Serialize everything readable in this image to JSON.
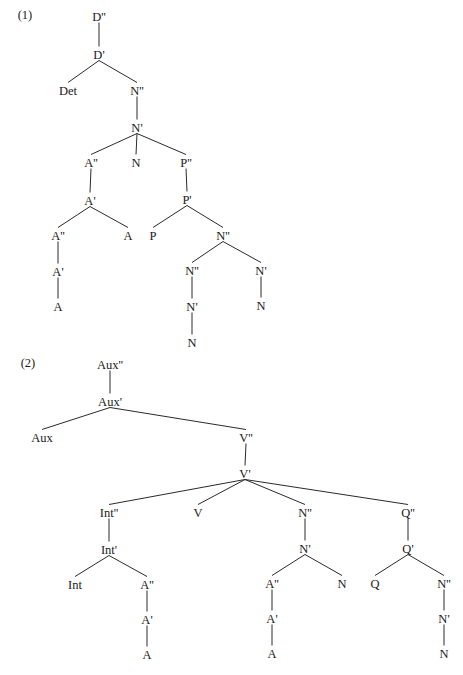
{
  "trees": [
    {
      "example_label": "(1)",
      "label_pos": [
        25,
        19
      ],
      "nodes": [
        {
          "id": "D2",
          "label": "D''",
          "x": 99,
          "y": 16
        },
        {
          "id": "D1",
          "label": "D'",
          "x": 99,
          "y": 54
        },
        {
          "id": "Det",
          "label": "Det",
          "x": 68,
          "y": 90
        },
        {
          "id": "N2a",
          "label": "N''",
          "x": 137,
          "y": 90
        },
        {
          "id": "N1a",
          "label": "N'",
          "x": 137,
          "y": 127
        },
        {
          "id": "A2a",
          "label": "A''",
          "x": 91,
          "y": 162
        },
        {
          "id": "Na",
          "label": "N",
          "x": 136,
          "y": 162
        },
        {
          "id": "P2",
          "label": "P''",
          "x": 186,
          "y": 162
        },
        {
          "id": "A1a",
          "label": "A'",
          "x": 90,
          "y": 200
        },
        {
          "id": "P1",
          "label": "P'",
          "x": 187,
          "y": 199
        },
        {
          "id": "A2b",
          "label": "A''",
          "x": 58,
          "y": 235
        },
        {
          "id": "Ab",
          "label": "A",
          "x": 128,
          "y": 235
        },
        {
          "id": "P",
          "label": "P",
          "x": 153,
          "y": 235
        },
        {
          "id": "N2b",
          "label": "N''",
          "x": 223,
          "y": 235
        },
        {
          "id": "A1b",
          "label": "A'",
          "x": 58,
          "y": 271
        },
        {
          "id": "N2c",
          "label": "N''",
          "x": 192,
          "y": 270
        },
        {
          "id": "N1c",
          "label": "N'",
          "x": 261,
          "y": 270
        },
        {
          "id": "Ac",
          "label": "A",
          "x": 58,
          "y": 306
        },
        {
          "id": "N1d",
          "label": "N'",
          "x": 192,
          "y": 306
        },
        {
          "id": "Nc",
          "label": "N",
          "x": 261,
          "y": 305
        },
        {
          "id": "Nd",
          "label": "N",
          "x": 192,
          "y": 342
        }
      ],
      "edges": [
        [
          "D2",
          "D1"
        ],
        [
          "D1",
          "Det"
        ],
        [
          "D1",
          "N2a"
        ],
        [
          "N2a",
          "N1a"
        ],
        [
          "N1a",
          "A2a"
        ],
        [
          "N1a",
          "Na"
        ],
        [
          "N1a",
          "P2"
        ],
        [
          "A2a",
          "A1a"
        ],
        [
          "A1a",
          "A2b"
        ],
        [
          "A1a",
          "Ab"
        ],
        [
          "A2b",
          "A1b"
        ],
        [
          "A1b",
          "Ac"
        ],
        [
          "P2",
          "P1"
        ],
        [
          "P1",
          "P"
        ],
        [
          "P1",
          "N2b"
        ],
        [
          "N2b",
          "N2c"
        ],
        [
          "N2b",
          "N1c"
        ],
        [
          "N2c",
          "N1d"
        ],
        [
          "N1d",
          "Nd"
        ],
        [
          "N1c",
          "Nc"
        ]
      ]
    },
    {
      "example_label": "(2)",
      "label_pos": [
        28,
        367
      ],
      "nodes": [
        {
          "id": "Aux2",
          "label": "Aux''",
          "x": 110,
          "y": 364
        },
        {
          "id": "Aux1",
          "label": "Aux'",
          "x": 110,
          "y": 401
        },
        {
          "id": "Aux",
          "label": "Aux",
          "x": 42,
          "y": 437
        },
        {
          "id": "V2",
          "label": "V''",
          "x": 246,
          "y": 437
        },
        {
          "id": "V1",
          "label": "V'",
          "x": 245,
          "y": 473
        },
        {
          "id": "Int2",
          "label": "Int''",
          "x": 109,
          "y": 512
        },
        {
          "id": "V",
          "label": "V",
          "x": 198,
          "y": 512
        },
        {
          "id": "N2x",
          "label": "N''",
          "x": 305,
          "y": 512
        },
        {
          "id": "Q2",
          "label": "Q''",
          "x": 408,
          "y": 512
        },
        {
          "id": "Int1",
          "label": "Int'",
          "x": 109,
          "y": 549
        },
        {
          "id": "N1x",
          "label": "N'",
          "x": 305,
          "y": 548
        },
        {
          "id": "Q1",
          "label": "Q'",
          "x": 408,
          "y": 548
        },
        {
          "id": "Int",
          "label": "Int",
          "x": 75,
          "y": 584
        },
        {
          "id": "A2x",
          "label": "A''",
          "x": 147,
          "y": 584
        },
        {
          "id": "A2y",
          "label": "A''",
          "x": 272,
          "y": 583
        },
        {
          "id": "Nx",
          "label": "N",
          "x": 342,
          "y": 583
        },
        {
          "id": "Q",
          "label": "Q",
          "x": 375,
          "y": 583
        },
        {
          "id": "N2y",
          "label": "N''",
          "x": 444,
          "y": 583
        },
        {
          "id": "A1x",
          "label": "A'",
          "x": 147,
          "y": 619
        },
        {
          "id": "A1y",
          "label": "A'",
          "x": 272,
          "y": 618
        },
        {
          "id": "N1y",
          "label": "N'",
          "x": 444,
          "y": 618
        },
        {
          "id": "Ax",
          "label": "A",
          "x": 147,
          "y": 654
        },
        {
          "id": "Ay",
          "label": "A",
          "x": 272,
          "y": 653
        },
        {
          "id": "Ny",
          "label": "N",
          "x": 444,
          "y": 653
        }
      ],
      "edges": [
        [
          "Aux2",
          "Aux1"
        ],
        [
          "Aux1",
          "Aux"
        ],
        [
          "Aux1",
          "V2"
        ],
        [
          "V2",
          "V1"
        ],
        [
          "V1",
          "Int2"
        ],
        [
          "V1",
          "V"
        ],
        [
          "V1",
          "N2x"
        ],
        [
          "V1",
          "Q2"
        ],
        [
          "Int2",
          "Int1"
        ],
        [
          "Int1",
          "Int"
        ],
        [
          "Int1",
          "A2x"
        ],
        [
          "A2x",
          "A1x"
        ],
        [
          "A1x",
          "Ax"
        ],
        [
          "N2x",
          "N1x"
        ],
        [
          "N1x",
          "A2y"
        ],
        [
          "N1x",
          "Nx"
        ],
        [
          "A2y",
          "A1y"
        ],
        [
          "A1y",
          "Ay"
        ],
        [
          "Q2",
          "Q1"
        ],
        [
          "Q1",
          "Q"
        ],
        [
          "Q1",
          "N2y"
        ],
        [
          "N2y",
          "N1y"
        ],
        [
          "N1y",
          "Ny"
        ]
      ]
    }
  ],
  "colors": {
    "text": "#1a1a1a",
    "line": "#2a2a2a",
    "background": "#ffffff"
  }
}
